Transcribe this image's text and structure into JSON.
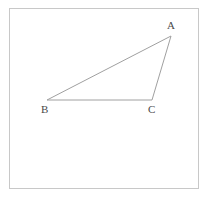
{
  "figure": {
    "type": "geometry-diagram",
    "background_color": "#ffffff",
    "frame": {
      "name": "figure-border",
      "color": "#c8c8c8",
      "x": 9,
      "y": 8,
      "width": 190,
      "height": 181
    },
    "stroke_color": "#a0a0a0",
    "stroke_width": 1,
    "label_color": "#4a4a4a",
    "vertices": [
      {
        "id": "A",
        "label": "A",
        "x": 171,
        "y": 36,
        "label_x": 167,
        "label_y": 20
      },
      {
        "id": "B",
        "label": "B",
        "x": 47,
        "y": 100,
        "label_x": 41,
        "label_y": 104
      },
      {
        "id": "C",
        "label": "C",
        "x": 152,
        "y": 100,
        "label_x": 148,
        "label_y": 104
      }
    ],
    "edges": [
      {
        "id": "BA",
        "from": "B",
        "to": "A"
      },
      {
        "id": "AC",
        "from": "A",
        "to": "C"
      },
      {
        "id": "CB",
        "from": "C",
        "to": "B"
      }
    ],
    "polygon_points": "47,100 171,36 152,100"
  }
}
